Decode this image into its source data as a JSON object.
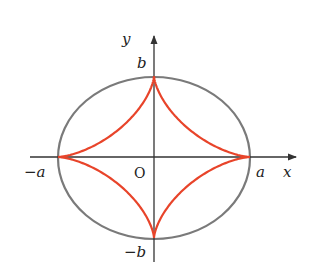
{
  "figure": {
    "axes": {
      "x_label": "x",
      "y_label": "y"
    },
    "labels": {
      "a": "a",
      "neg_a": "−a",
      "b": "b",
      "neg_b": "−b",
      "origin": "O"
    },
    "colors": {
      "ellipse": "#7a7a7a",
      "astroid": "#e8442a",
      "axis": "#333333"
    }
  }
}
